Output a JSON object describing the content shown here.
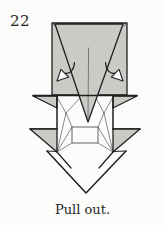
{
  "step": {
    "number": "22",
    "caption": "Pull out."
  },
  "diagram": {
    "elements": [
      "head-rectangle",
      "beak-triangle",
      "pull-out-arrow-left",
      "pull-out-arrow-right",
      "upper-wing-flap-left",
      "upper-wing-flap-right",
      "lower-wing-flap-left",
      "lower-wing-flap-right",
      "center-pocket-rectangle",
      "tail-triangle",
      "crease-lines"
    ],
    "colors": {
      "paper": "#fcfcfa",
      "shape_fill": "#cbcac7",
      "outline": "#1f1f1f",
      "crease": "#4a4a4a"
    }
  }
}
